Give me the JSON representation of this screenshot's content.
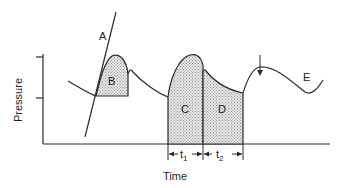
{
  "diagram": {
    "type": "pressure-time curve",
    "axes": {
      "ylabel": "Pressure",
      "xlabel": "Time"
    },
    "labels": {
      "A": "A",
      "B": "B",
      "C": "C",
      "D": "D",
      "E": "E"
    },
    "intervals": {
      "t1_base": "t",
      "t1_sub": "1",
      "t2_base": "t",
      "t2_sub": "2"
    },
    "colors": {
      "line": "#2a2a2a",
      "fill": "#cfcfcf"
    }
  }
}
